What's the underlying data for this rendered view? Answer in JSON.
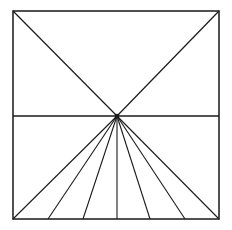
{
  "figure": {
    "canvas": {
      "width": 232,
      "height": 230,
      "background_color": "#ffffff"
    },
    "colors": {
      "stroke": "#1a1a1a",
      "fill": "#ffffff",
      "frame_stroke": "#262626"
    },
    "stroke_widths": {
      "frame": 1.6,
      "horizon": 1.4,
      "diagonal": 1.2,
      "ray": 1.1
    },
    "frame": {
      "label": "square border",
      "left": 13,
      "top": 11,
      "right": 219,
      "bottom": 219,
      "width": 206,
      "height": 208
    },
    "vanishing_point": {
      "label": "vanishing point",
      "x": 117,
      "y": 116,
      "marker_size": 4.2
    },
    "horizon_line": {
      "label": "horizon line",
      "x1": 13,
      "y1": 116,
      "x2": 219,
      "y2": 116
    },
    "diagonals": [
      {
        "label": "diagonal from top-left corner",
        "x1": 13,
        "y1": 11,
        "x2": 117,
        "y2": 116
      },
      {
        "label": "diagonal from top-right corner",
        "x1": 219,
        "y1": 11,
        "x2": 117,
        "y2": 116
      }
    ],
    "rays": [
      {
        "label": "ray to bottom-left corner",
        "x1": 117,
        "y1": 116,
        "x2": 13,
        "y2": 219
      },
      {
        "label": "ray 2",
        "x1": 117,
        "y1": 116,
        "x2": 48,
        "y2": 219
      },
      {
        "label": "ray 3",
        "x1": 117,
        "y1": 116,
        "x2": 83,
        "y2": 219
      },
      {
        "label": "center vertical ray",
        "x1": 117,
        "y1": 116,
        "x2": 117,
        "y2": 219
      },
      {
        "label": "ray 5",
        "x1": 117,
        "y1": 116,
        "x2": 150,
        "y2": 219
      },
      {
        "label": "ray 6",
        "x1": 117,
        "y1": 116,
        "x2": 185,
        "y2": 219
      },
      {
        "label": "ray to bottom-right corner",
        "x1": 117,
        "y1": 116,
        "x2": 219,
        "y2": 219
      }
    ],
    "counts": {
      "rays": 7,
      "diagonals": 2,
      "horizon_lines": 1
    }
  }
}
